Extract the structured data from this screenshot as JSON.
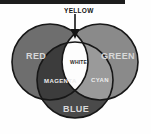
{
  "diagram": {
    "title_bar": {
      "present": true,
      "color": "#1d1d1d"
    },
    "type": "additive-color-venn-diagram",
    "regions": {
      "red": {
        "label": "RED",
        "fill": "#6e6e6e"
      },
      "green": {
        "label": "GREEN",
        "fill": "#8a8a8a"
      },
      "blue": {
        "label": "BLUE",
        "fill": "#4a4a4a"
      },
      "yellow": {
        "label": "YELLOW",
        "fill": "#f4f4f4"
      },
      "magenta": {
        "label": "MAGENTA",
        "fill": "#3c3c3c"
      },
      "cyan": {
        "label": "CYAN",
        "fill": "#9a9a9a"
      },
      "white": {
        "label": "WHITE",
        "fill": "#fdfdfd"
      }
    },
    "callout": {
      "label": "YELLOW",
      "arrow": "down-arrow-icon"
    },
    "stroke": "#171717"
  }
}
